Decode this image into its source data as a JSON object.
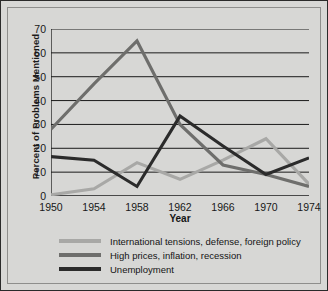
{
  "chart_data": {
    "type": "line",
    "title": "",
    "xlabel": "Year",
    "ylabel": "Percent of Problems Mentioned",
    "x": [
      1950,
      1954,
      1958,
      1962,
      1966,
      1970,
      1974
    ],
    "xticklabels": [
      "1950",
      "1954",
      "1958",
      "1962",
      "1966",
      "1970",
      "1974"
    ],
    "xlim": [
      1950,
      1974
    ],
    "ylim": [
      0,
      70
    ],
    "yticks": [
      0,
      10,
      20,
      30,
      40,
      50,
      60,
      70
    ],
    "yticklabels": [
      "0",
      "10",
      "20",
      "30",
      "40",
      "50",
      "60",
      "70"
    ],
    "grid": "horizontal",
    "legend_position": "below",
    "series": [
      {
        "name": "International tensions, defense, foreign policy",
        "color": "#a8a8a6",
        "values": [
          0.5,
          3,
          14,
          7,
          15,
          24,
          5
        ]
      },
      {
        "name": "High prices, inflation, recession",
        "color": "#6e6e6c",
        "values": [
          28,
          47,
          65,
          30,
          13,
          9,
          4
        ]
      },
      {
        "name": "Unemployment",
        "color": "#2b2b2b",
        "values": [
          16.5,
          15,
          4,
          33.5,
          21,
          9,
          16
        ]
      }
    ]
  },
  "axis": {
    "ylabel": "Percent of Problems Mentioned",
    "xlabel": "Year"
  }
}
